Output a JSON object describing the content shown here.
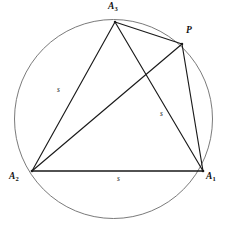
{
  "figure": {
    "name": "inscribed-equilateral-triangle-with-point-p",
    "colors": {
      "circle_stroke": "#6b6b6b",
      "chord_stroke": "#1a1a1a",
      "label_text": "#111111",
      "background": "#ffffff"
    },
    "circle": {
      "center_x": 113.5,
      "center_y": 119,
      "radius": 99
    },
    "points": [
      {
        "id": "A3",
        "label": "A",
        "subscript": "3",
        "x": 115,
        "y": 22,
        "label_x": 108,
        "label_y": 2
      },
      {
        "id": "P",
        "label": "P",
        "subscript": "",
        "x": 182,
        "y": 44,
        "label_x": 186,
        "label_y": 26
      },
      {
        "id": "A1",
        "label": "A",
        "subscript": "1",
        "x": 203,
        "y": 171,
        "label_x": 206,
        "label_y": 172
      },
      {
        "id": "A2",
        "label": "A",
        "subscript": "2",
        "x": 32,
        "y": 171,
        "label_x": 9,
        "label_y": 172
      }
    ],
    "segments": [
      {
        "id": "A3-A2",
        "from": "A3",
        "to": "A2",
        "weight": "normal"
      },
      {
        "id": "A3-A1",
        "from": "A3",
        "to": "A1",
        "weight": "normal"
      },
      {
        "id": "A3-P",
        "from": "A3",
        "to": "P",
        "weight": "normal"
      },
      {
        "id": "P-A2",
        "from": "P",
        "to": "A2",
        "weight": "normal"
      },
      {
        "id": "P-A1",
        "from": "P",
        "to": "A1",
        "weight": "normal"
      },
      {
        "id": "A2-A1",
        "from": "A2",
        "to": "A1",
        "weight": "base"
      }
    ],
    "side_labels": [
      {
        "id": "s-left",
        "text": "s",
        "on_segment": "A3-A2",
        "x": 57,
        "y": 86
      },
      {
        "id": "s-right",
        "text": "s",
        "on_segment": "A3-A1",
        "x": 160,
        "y": 110
      },
      {
        "id": "s-bottom",
        "text": "s",
        "on_segment": "A2-A1",
        "x": 117,
        "y": 175
      }
    ]
  }
}
